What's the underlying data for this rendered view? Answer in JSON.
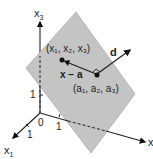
{
  "diagram": {
    "axes": {
      "x1": {
        "label": "x",
        "sub": "1",
        "tick": "1"
      },
      "x2": {
        "label": "x",
        "sub": "2",
        "tick": "1"
      },
      "x3": {
        "label": "x",
        "sub": "3",
        "tick": "1"
      },
      "origin": "0"
    },
    "points": {
      "x_point": "(x₁, x₂, x₃)",
      "a_point": "(a₁, a₂, a₃)"
    },
    "vectors": {
      "x_minus_a": "x − a",
      "d": "d"
    },
    "colors": {
      "plane": "#c4c4c4",
      "plane_edge": "#9a9a9a",
      "lines": "#222222"
    }
  }
}
